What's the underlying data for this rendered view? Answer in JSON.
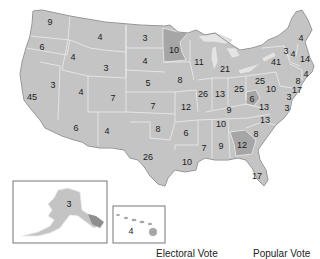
{
  "map": {
    "title": "US Electoral Votes by State",
    "colors": {
      "default_fill": "#c4c4c4",
      "highlight_fill": "#a6a6a6",
      "border": "#ececec",
      "outline": "#8a8a8a"
    },
    "highlighted_states": [
      "MN",
      "GA",
      "WV"
    ]
  },
  "states": [
    {
      "code": "WA",
      "votes": "9",
      "x": 50,
      "y": 22
    },
    {
      "code": "OR",
      "votes": "6",
      "x": 42,
      "y": 47
    },
    {
      "code": "CA",
      "votes": "45",
      "x": 32,
      "y": 97
    },
    {
      "code": "ID",
      "votes": "4",
      "x": 73,
      "y": 57
    },
    {
      "code": "NV",
      "votes": "3",
      "x": 53,
      "y": 85
    },
    {
      "code": "MT",
      "votes": "4",
      "x": 100,
      "y": 37
    },
    {
      "code": "WY",
      "votes": "3",
      "x": 106,
      "y": 68
    },
    {
      "code": "UT",
      "votes": "4",
      "x": 81,
      "y": 92
    },
    {
      "code": "CO",
      "votes": "7",
      "x": 113,
      "y": 98
    },
    {
      "code": "AZ",
      "votes": "6",
      "x": 76,
      "y": 128
    },
    {
      "code": "NM",
      "votes": "4",
      "x": 107,
      "y": 131
    },
    {
      "code": "ND",
      "votes": "3",
      "x": 145,
      "y": 38
    },
    {
      "code": "SD",
      "votes": "4",
      "x": 145,
      "y": 61
    },
    {
      "code": "NE",
      "votes": "5",
      "x": 148,
      "y": 83
    },
    {
      "code": "KS",
      "votes": "7",
      "x": 153,
      "y": 106
    },
    {
      "code": "OK",
      "votes": "8",
      "x": 158,
      "y": 129
    },
    {
      "code": "TX",
      "votes": "26",
      "x": 148,
      "y": 157
    },
    {
      "code": "MN",
      "votes": "10",
      "x": 174,
      "y": 50
    },
    {
      "code": "IA",
      "votes": "8",
      "x": 180,
      "y": 80
    },
    {
      "code": "MO",
      "votes": "12",
      "x": 186,
      "y": 107
    },
    {
      "code": "AR",
      "votes": "6",
      "x": 186,
      "y": 133
    },
    {
      "code": "LA",
      "votes": "10",
      "x": 187,
      "y": 162
    },
    {
      "code": "WI",
      "votes": "11",
      "x": 199,
      "y": 62
    },
    {
      "code": "IL",
      "votes": "26",
      "x": 203,
      "y": 94
    },
    {
      "code": "MI",
      "votes": "21",
      "x": 225,
      "y": 69
    },
    {
      "code": "IN",
      "votes": "13",
      "x": 220,
      "y": 94
    },
    {
      "code": "OH",
      "votes": "25",
      "x": 239,
      "y": 89
    },
    {
      "code": "KY",
      "votes": "9",
      "x": 229,
      "y": 110
    },
    {
      "code": "TN",
      "votes": "10",
      "x": 221,
      "y": 124
    },
    {
      "code": "MS",
      "votes": "7",
      "x": 204,
      "y": 148
    },
    {
      "code": "AL",
      "votes": "9",
      "x": 221,
      "y": 146
    },
    {
      "code": "GA",
      "votes": "12",
      "x": 242,
      "y": 145
    },
    {
      "code": "FL",
      "votes": "17",
      "x": 257,
      "y": 176
    },
    {
      "code": "SC",
      "votes": "8",
      "x": 256,
      "y": 134
    },
    {
      "code": "NC",
      "votes": "13",
      "x": 265,
      "y": 120
    },
    {
      "code": "VA",
      "votes": "13",
      "x": 264,
      "y": 107
    },
    {
      "code": "WV",
      "votes": "6",
      "x": 252,
      "y": 99
    },
    {
      "code": "PA",
      "votes": "25",
      "x": 260,
      "y": 81
    },
    {
      "code": "NY",
      "votes": "41",
      "x": 276,
      "y": 62
    },
    {
      "code": "ME",
      "votes": "4",
      "x": 301,
      "y": 38
    },
    {
      "code": "VT",
      "votes": "3",
      "x": 286,
      "y": 51
    },
    {
      "code": "NH",
      "votes": "4",
      "x": 293,
      "y": 54
    },
    {
      "code": "MA",
      "votes": "14",
      "x": 305,
      "y": 59
    },
    {
      "code": "RI",
      "votes": "4",
      "x": 306,
      "y": 74
    },
    {
      "code": "CT",
      "votes": "8",
      "x": 298,
      "y": 81
    },
    {
      "code": "NJ",
      "votes": "17",
      "x": 297,
      "y": 90
    },
    {
      "code": "DE",
      "votes": "3",
      "x": 289,
      "y": 97
    },
    {
      "code": "MD",
      "votes": "10",
      "x": 271,
      "y": 89
    },
    {
      "code": "DC",
      "votes": "3",
      "x": 287,
      "y": 108
    },
    {
      "code": "AK",
      "votes": "3",
      "x": 69,
      "y": 204
    },
    {
      "code": "HI",
      "votes": "4",
      "x": 131,
      "y": 231
    }
  ],
  "legend": {
    "electoral_vote_label": "Electoral Vote",
    "popular_vote_label": "Popular Vote"
  }
}
